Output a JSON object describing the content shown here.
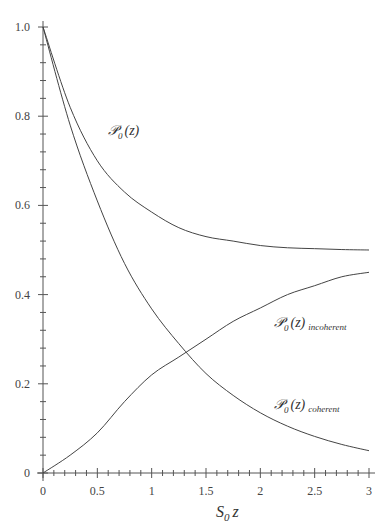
{
  "chart_data": {
    "type": "line",
    "title": "",
    "xlabel": "S0 z",
    "ylabel": "",
    "xlim": [
      0,
      3
    ],
    "ylim": [
      0,
      1.0
    ],
    "grid": false,
    "legend": "inline labels",
    "x_ticks": [
      "0",
      "0.5",
      "1",
      "1.5",
      "2",
      "2.5",
      "3"
    ],
    "y_ticks": [
      "0",
      "0.2",
      "0.4",
      "0.6",
      "0.8",
      "1.0"
    ],
    "x": [
      0,
      0.25,
      0.5,
      0.75,
      1.0,
      1.25,
      1.5,
      1.75,
      2.0,
      2.25,
      2.5,
      2.75,
      3.0
    ],
    "series": [
      {
        "name": "P0(z)",
        "values": [
          1.0,
          0.82,
          0.7,
          0.63,
          0.585,
          0.55,
          0.53,
          0.52,
          0.51,
          0.505,
          0.503,
          0.501,
          0.5
        ]
      },
      {
        "name": "P0(z) incoherent",
        "values": [
          0.0,
          0.04,
          0.09,
          0.16,
          0.22,
          0.26,
          0.3,
          0.34,
          0.37,
          0.4,
          0.42,
          0.44,
          0.45
        ]
      },
      {
        "name": "P0(z) coherent",
        "values": [
          1.0,
          0.78,
          0.61,
          0.47,
          0.368,
          0.29,
          0.223,
          0.174,
          0.135,
          0.105,
          0.082,
          0.064,
          0.05
        ]
      }
    ],
    "annotations": [
      {
        "text": "P0(z)",
        "x": 0.82,
        "y": 0.78
      },
      {
        "text": "P0(z) incoherent",
        "x": 2.0,
        "y": 0.33
      },
      {
        "text": "P0(z) coherent",
        "x": 2.0,
        "y": 0.17
      }
    ]
  },
  "labels": {
    "x_axis_main": "S",
    "x_axis_sub": "0",
    "x_axis_tail": "z",
    "total_main": "𝒫",
    "total_sub": "0",
    "total_tail": "(z)",
    "incoherent_sub2": "incoherent",
    "coherent_sub2": "coherent"
  }
}
